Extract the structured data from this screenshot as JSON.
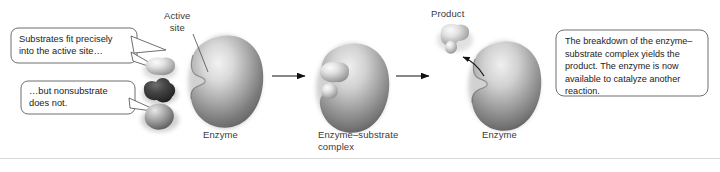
{
  "figure": {
    "background_color": "#ffffff",
    "ink_color": "#3a3a3a"
  },
  "callouts": [
    {
      "id": "substrate-fit",
      "text": "Substrates fit precisely\ninto the active site…"
    },
    {
      "id": "nonsubstrate",
      "text": "…but nonsubstrate\ndoes not."
    }
  ],
  "note_box": {
    "text": "The breakdown of the enzyme–\nsubstrate complex yields the\nproduct. The enzyme is now\navailable to catalyze another\nreaction."
  },
  "labels": {
    "active_site": "Active\nsite",
    "enzyme_stage1": "Enzyme",
    "complex": "Enzyme–substrate\ncomplex",
    "product": "Product",
    "enzyme_stage3": "Enzyme"
  },
  "stages": [
    {
      "id": "stage-1",
      "name": "free-enzyme-with-substrates"
    },
    {
      "id": "stage-2",
      "name": "enzyme-substrate-complex"
    },
    {
      "id": "stage-3",
      "name": "product-release"
    }
  ],
  "arrows": [
    {
      "id": "arrow-1",
      "from": "stage-1",
      "to": "stage-2"
    },
    {
      "id": "arrow-2",
      "from": "stage-2",
      "to": "stage-3"
    },
    {
      "id": "release-arrow",
      "from": "active-site",
      "to": "product"
    }
  ],
  "molecules": [
    {
      "id": "substrate",
      "shade": "light"
    },
    {
      "id": "nonsubstrate",
      "shade": "dark"
    },
    {
      "id": "nonsubstrate-2",
      "shade": "medium"
    },
    {
      "id": "product",
      "shade": "light"
    }
  ]
}
